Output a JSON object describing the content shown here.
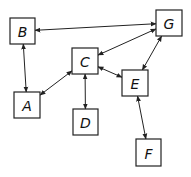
{
  "diagram": {
    "type": "network-graph",
    "nodes": [
      {
        "id": "A",
        "label": "A",
        "x": 14,
        "y": 92,
        "w": 26,
        "h": 26
      },
      {
        "id": "B",
        "label": "B",
        "x": 10,
        "y": 18,
        "w": 25,
        "h": 26
      },
      {
        "id": "C",
        "label": "C",
        "x": 72,
        "y": 48,
        "w": 26,
        "h": 26
      },
      {
        "id": "D",
        "label": "D",
        "x": 73,
        "y": 109,
        "w": 25,
        "h": 26
      },
      {
        "id": "E",
        "label": "E",
        "x": 122,
        "y": 70,
        "w": 26,
        "h": 26
      },
      {
        "id": "F",
        "label": "F",
        "x": 136,
        "y": 139,
        "w": 25,
        "h": 27
      },
      {
        "id": "G",
        "label": "G",
        "x": 156,
        "y": 10,
        "w": 26,
        "h": 26
      }
    ],
    "edges": [
      {
        "from": "B",
        "to": "G",
        "bidirectional": true
      },
      {
        "from": "B",
        "to": "A",
        "bidirectional": true
      },
      {
        "from": "G",
        "to": "C",
        "bidirectional": true
      },
      {
        "from": "G",
        "to": "E",
        "bidirectional": true
      },
      {
        "from": "C",
        "to": "A",
        "bidirectional": true
      },
      {
        "from": "C",
        "to": "D",
        "bidirectional": true
      },
      {
        "from": "C",
        "to": "E",
        "bidirectional": true
      },
      {
        "from": "E",
        "to": "F",
        "bidirectional": true
      }
    ]
  }
}
